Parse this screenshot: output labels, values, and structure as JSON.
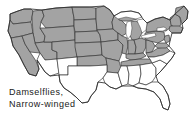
{
  "figure": {
    "type": "range-map",
    "region": "United States",
    "caption_lines": [
      "Damselflies,",
      "Narrow-winged"
    ],
    "caption_line_1": "Damselflies,",
    "caption_line_2": "Narrow-winged",
    "colors": {
      "range_fill": "#a3a3a3",
      "no_range_fill": "#ffffff",
      "border_stroke": "#3a3a3a",
      "background": "#ffffff",
      "text": "#1a1a1a"
    },
    "legend": {
      "shaded_meaning": "range present",
      "unshaded_meaning": "range absent"
    },
    "states_shaded": [
      "Washington",
      "Oregon",
      "California",
      "Idaho",
      "Nevada",
      "Utah",
      "Montana",
      "Wyoming",
      "Colorado",
      "North Dakota",
      "South Dakota",
      "Nebraska",
      "Kansas",
      "Minnesota",
      "Iowa",
      "Missouri",
      "Wisconsin",
      "Illinois",
      "Michigan",
      "Indiana",
      "Ohio",
      "Kentucky",
      "West Virginia",
      "Virginia",
      "Pennsylvania",
      "New York",
      "Vermont",
      "New Hampshire",
      "Maine",
      "Massachusetts",
      "Connecticut",
      "Rhode Island",
      "New Jersey",
      "Maryland",
      "Delaware",
      "Tennessee",
      "Oklahoma",
      "Arkansas",
      "Texas Panhandle"
    ],
    "states_unshaded": [
      "Arizona",
      "New Mexico",
      "Texas",
      "Louisiana",
      "Mississippi",
      "Alabama",
      "Georgia",
      "Florida",
      "South Carolina",
      "North Carolina"
    ]
  }
}
